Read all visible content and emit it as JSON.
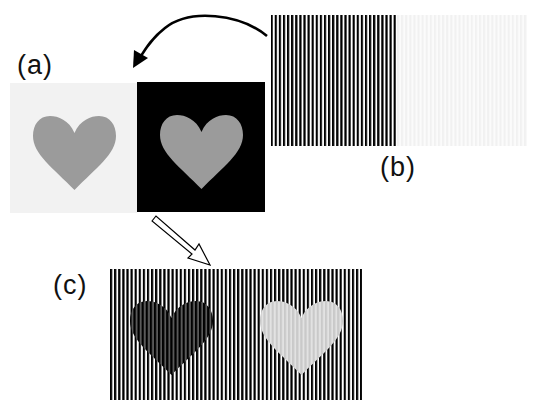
{
  "labels": {
    "a": "(a)",
    "b": "(b)",
    "c": "(c)"
  },
  "colors": {
    "background": "#ffffff",
    "light_panel": "#f2f2f2",
    "dark_panel": "#000000",
    "heart_gray": "#9b9b9b",
    "stripe_black": "#000000",
    "stripe_white": "#ffffff",
    "faint_stripe": "#f4f4f4",
    "dark_heart_stripe": "#5a5a5a",
    "light_heart_stripe_a": "#c9c9c9",
    "light_heart_stripe_b": "#e2e2e2"
  },
  "panels": {
    "a": {
      "description": "Gray heart on light background and gray heart on black background",
      "left_panel": {
        "x": 10,
        "y": 83,
        "w": 127,
        "h": 130
      },
      "right_panel": {
        "x": 137,
        "y": 82,
        "w": 128,
        "h": 130
      }
    },
    "b": {
      "description": "High-contrast vertical grating and faint grating",
      "striped_panel": {
        "x": 271,
        "y": 15,
        "w": 126,
        "h": 131,
        "stripe_period": 4.1
      },
      "faint_panel": {
        "x": 397,
        "y": 15,
        "w": 130,
        "h": 131
      }
    },
    "c": {
      "description": "Combined: grating overlaid on hearts; left heart appears darker, right heart lighter",
      "panel": {
        "x": 110,
        "y": 269,
        "w": 252,
        "h": 131,
        "stripe_period": 4.1
      }
    }
  },
  "arrows": {
    "curved": {
      "from": "b",
      "to": "a",
      "style": "solid-curved"
    },
    "hollow": {
      "from": "a",
      "to": "c",
      "style": "hollow-straight"
    }
  }
}
